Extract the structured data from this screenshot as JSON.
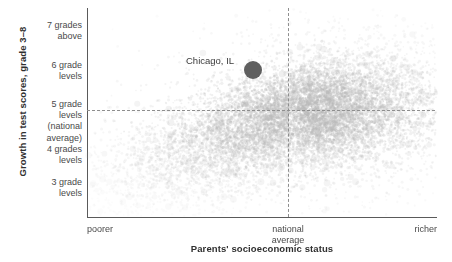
{
  "chart_data": {
    "type": "scatter",
    "title": "",
    "xlabel": "Parents' socioeconomic status",
    "ylabel": "Growth in test scores, grade 3–8",
    "grid": false,
    "legend": "none",
    "xlim": [
      -4.0,
      4.0
    ],
    "ylim": [
      2.6,
      7.6
    ],
    "xticks": [
      {
        "label": "poorer",
        "position": "left"
      },
      {
        "label": "national\naverage",
        "position": "center"
      },
      {
        "label": "richer",
        "position": "right"
      }
    ],
    "xtick_labels": [
      "poorer",
      "national average",
      "richer"
    ],
    "yticks": [
      {
        "label": "7 grades above",
        "value": 7.0,
        "y_px": 31
      },
      {
        "label": "6 grade levels",
        "value": 6.0,
        "y_px": 71
      },
      {
        "label": "5 grade levels (national average)",
        "value": 5.0,
        "y_px": 110
      },
      {
        "label": "4 grades levels",
        "value": 4.0,
        "y_px": 150
      },
      {
        "label": "3 grade levels",
        "value": 3.0,
        "y_px": 182
      }
    ],
    "reference_lines": [
      {
        "orientation": "horizontal",
        "label": "national average growth",
        "value": 5.0,
        "style": "dashed"
      },
      {
        "orientation": "vertical",
        "label": "national average socioeconomic status",
        "value": 0.0,
        "style": "dashed"
      }
    ],
    "annotations": [
      {
        "label": "Chicago, IL",
        "x_px": 253,
        "y_px": 70,
        "marker_radius_px": 9,
        "marker_color": "#5f5f5f",
        "description": "above national average in both growth and socioeconomic status"
      }
    ],
    "point_cloud": {
      "n_points_approx": 12000,
      "marker_color": "#b8b8b8",
      "center_x_px": 300,
      "center_y_px": 112,
      "spread_x_px": 62,
      "spread_y_px": 26,
      "description": "Dense gray cloud of US school districts; mass concentrated just right of the national-average vertical line and straddling the national-average horizontal line, with a long sparse tail extending down and to the left."
    }
  },
  "y_axis_tick_labels": [
    {
      "lines": [
        "7 grades",
        "above"
      ],
      "top": 20
    },
    {
      "lines": [
        "6 grade",
        "levels"
      ],
      "top": 60
    },
    {
      "lines": [
        "5 grade",
        "levels",
        "(national",
        "average)"
      ],
      "top": 99
    },
    {
      "lines": [
        "4 grades",
        "levels"
      ],
      "top": 144
    },
    {
      "lines": [
        "3 grade",
        "levels"
      ],
      "top": 177
    }
  ],
  "x_axis_tick_labels": {
    "left": "poorer",
    "center_line1": "national",
    "center_line2": "average",
    "right": "richer"
  },
  "axis_titles": {
    "y": "Growth in test scores, grade 3–8",
    "x": "Parents' socioeconomic status"
  },
  "highlight": {
    "label": "Chicago, IL"
  },
  "colors": {
    "point_cloud": "#b8b8b8",
    "highlight_marker": "#5f5f5f",
    "axis_line": "#5a5a5a",
    "reference_line": "#8e8e8e",
    "text": "#3c3c3c",
    "background": "#ffffff"
  }
}
